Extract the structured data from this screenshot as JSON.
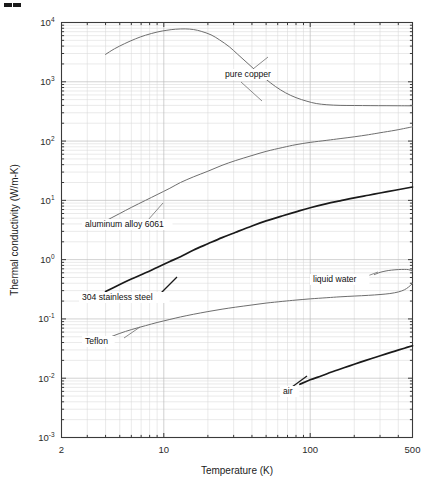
{
  "figure": {
    "corner_mark": "▰▰"
  },
  "chart_data": {
    "type": "line",
    "title": "",
    "xlabel": "Temperature (K)",
    "ylabel": "Thermal conductivity (W/m-K)",
    "xscale": "log",
    "yscale": "log",
    "xlim": [
      2,
      500
    ],
    "ylim": [
      0.001,
      10000
    ],
    "grid": true,
    "legend": "inline-labels",
    "xticks": [
      {
        "value": 2,
        "label": "2"
      },
      {
        "value": 10,
        "label": "10"
      },
      {
        "value": 100,
        "label": "100"
      },
      {
        "value": 500,
        "label": "500"
      }
    ],
    "yticks": [
      {
        "value": 10000,
        "mantissa": "10",
        "exponent": "4"
      },
      {
        "value": 1000,
        "mantissa": "10",
        "exponent": "3"
      },
      {
        "value": 100,
        "mantissa": "10",
        "exponent": "2"
      },
      {
        "value": 10,
        "mantissa": "10",
        "exponent": "1"
      },
      {
        "value": 1,
        "mantissa": "10",
        "exponent": "0"
      },
      {
        "value": 0.1,
        "mantissa": "10",
        "exponent": "-1"
      },
      {
        "value": 0.01,
        "mantissa": "10",
        "exponent": "-2"
      },
      {
        "value": 0.001,
        "mantissa": "10",
        "exponent": "-3"
      }
    ],
    "series": [
      {
        "name": "pure copper",
        "label": "pure copper",
        "style": "thin",
        "label_x": 225,
        "label_y": 77,
        "leader": "M 253 69 L 268 57",
        "leader2": "M 241 82 L 262 101",
        "points": [
          [
            4,
            2900
          ],
          [
            4.6,
            3600
          ],
          [
            5.4,
            4400
          ],
          [
            6.4,
            5300
          ],
          [
            7.5,
            6100
          ],
          [
            9,
            6900
          ],
          [
            10.5,
            7400
          ],
          [
            12,
            7700
          ],
          [
            14,
            7800
          ],
          [
            16,
            7600
          ],
          [
            18,
            7100
          ],
          [
            21,
            6200
          ],
          [
            24,
            5100
          ],
          [
            28,
            3900
          ],
          [
            32,
            2900
          ],
          [
            37,
            2100
          ],
          [
            43,
            1500
          ],
          [
            50,
            1100
          ],
          [
            58,
            830
          ],
          [
            68,
            650
          ],
          [
            80,
            540
          ],
          [
            95,
            470
          ],
          [
            110,
            430
          ],
          [
            130,
            410
          ],
          [
            160,
            400
          ],
          [
            200,
            398
          ],
          [
            260,
            396
          ],
          [
            330,
            395
          ],
          [
            420,
            394
          ],
          [
            500,
            393
          ]
        ]
      },
      {
        "name": "aluminum alloy 6061",
        "label": "aluminum alloy 6061",
        "style": "thin",
        "label_x": 85,
        "label_y": 227,
        "leader": "M 148 220 L 163 203",
        "points": [
          [
            4,
            4.5
          ],
          [
            5,
            6.0
          ],
          [
            6,
            7.6
          ],
          [
            7.5,
            10.0
          ],
          [
            9,
            12.5
          ],
          [
            11,
            16.0
          ],
          [
            13,
            20.0
          ],
          [
            16,
            25.0
          ],
          [
            20,
            31.0
          ],
          [
            25,
            39.0
          ],
          [
            31,
            47.0
          ],
          [
            40,
            57.0
          ],
          [
            50,
            67.0
          ],
          [
            65,
            78.0
          ],
          [
            80,
            87.0
          ],
          [
            100,
            95.0
          ],
          [
            130,
            103
          ],
          [
            160,
            110
          ],
          [
            200,
            118
          ],
          [
            250,
            128
          ],
          [
            300,
            138
          ],
          [
            380,
            152
          ],
          [
            450,
            165
          ],
          [
            500,
            174
          ]
        ]
      },
      {
        "name": "304 stainless steel",
        "label": "304 stainless steel",
        "style": "thick",
        "label_x": 82,
        "label_y": 300,
        "leader": "M 161 293 L 177 277",
        "points": [
          [
            4,
            0.29
          ],
          [
            5,
            0.38
          ],
          [
            6,
            0.47
          ],
          [
            7.5,
            0.6
          ],
          [
            9,
            0.74
          ],
          [
            11,
            0.93
          ],
          [
            13,
            1.12
          ],
          [
            16,
            1.45
          ],
          [
            20,
            1.85
          ],
          [
            25,
            2.35
          ],
          [
            31,
            2.9
          ],
          [
            40,
            3.7
          ],
          [
            50,
            4.5
          ],
          [
            65,
            5.5
          ],
          [
            80,
            6.4
          ],
          [
            100,
            7.5
          ],
          [
            130,
            8.8
          ],
          [
            160,
            9.8
          ],
          [
            200,
            11.0
          ],
          [
            250,
            12.2
          ],
          [
            300,
            13.3
          ],
          [
            380,
            14.8
          ],
          [
            450,
            16.0
          ],
          [
            500,
            16.8
          ]
        ]
      },
      {
        "name": "Teflon",
        "label": "Teflon",
        "style": "thin",
        "label_x": 85,
        "label_y": 344,
        "leader": "M 124 338 L 140 327",
        "points": [
          [
            4,
            0.046
          ],
          [
            5,
            0.057
          ],
          [
            6,
            0.066
          ],
          [
            7.5,
            0.077
          ],
          [
            9,
            0.087
          ],
          [
            11,
            0.098
          ],
          [
            13,
            0.108
          ],
          [
            16,
            0.12
          ],
          [
            20,
            0.133
          ],
          [
            25,
            0.146
          ],
          [
            31,
            0.158
          ],
          [
            40,
            0.172
          ],
          [
            50,
            0.185
          ],
          [
            65,
            0.198
          ],
          [
            80,
            0.208
          ],
          [
            100,
            0.218
          ],
          [
            130,
            0.228
          ],
          [
            160,
            0.236
          ],
          [
            200,
            0.243
          ],
          [
            250,
            0.25
          ],
          [
            300,
            0.258
          ],
          [
            350,
            0.268
          ],
          [
            400,
            0.285
          ],
          [
            440,
            0.31
          ],
          [
            470,
            0.345
          ],
          [
            500,
            0.395
          ]
        ]
      },
      {
        "name": "liquid water",
        "label": "liquid water",
        "style": "thin",
        "label_x": 313,
        "label_y": 282,
        "leader": "M 362 278 L 378 272",
        "points": [
          [
            275,
            0.56
          ],
          [
            300,
            0.61
          ],
          [
            330,
            0.645
          ],
          [
            360,
            0.666
          ],
          [
            400,
            0.68
          ],
          [
            440,
            0.684
          ],
          [
            470,
            0.678
          ],
          [
            500,
            0.643
          ]
        ]
      },
      {
        "name": "air",
        "label": "air",
        "style": "thick",
        "label_x": 283,
        "label_y": 394,
        "leader": "M 292 387 L 307 376",
        "points": [
          [
            85,
            0.0079
          ],
          [
            100,
            0.0094
          ],
          [
            120,
            0.011
          ],
          [
            140,
            0.0127
          ],
          [
            170,
            0.015
          ],
          [
            200,
            0.0172
          ],
          [
            240,
            0.02
          ],
          [
            280,
            0.0226
          ],
          [
            330,
            0.0257
          ],
          [
            380,
            0.0287
          ],
          [
            440,
            0.0321
          ],
          [
            500,
            0.0353
          ]
        ]
      }
    ]
  }
}
